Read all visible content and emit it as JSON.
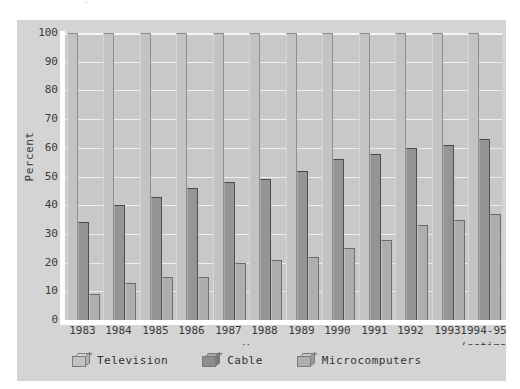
{
  "title_remnant": "\"",
  "chart_data": {
    "type": "bar",
    "title": "",
    "xlabel": "Year",
    "ylabel": "Percent",
    "ylim": [
      0,
      100
    ],
    "yticks": [
      100,
      90,
      80,
      70,
      60,
      50,
      40,
      30,
      20,
      10,
      0
    ],
    "grid": true,
    "legend_position": "bottom",
    "categories": [
      "1983",
      "1984",
      "1985",
      "1986",
      "1987",
      "1988",
      "1989",
      "1990",
      "1991",
      "1992",
      "1993",
      "1994-95"
    ],
    "category_sublabels": [
      "",
      "",
      "",
      "",
      "",
      "",
      "",
      "",
      "",
      "",
      "",
      "(estima"
    ],
    "series": [
      {
        "name": "Television",
        "color": "#c3c3c3",
        "values": [
          100,
          100,
          100,
          100,
          100,
          100,
          100,
          100,
          100,
          100,
          100,
          100
        ]
      },
      {
        "name": "Cable",
        "color": "#8e8e8e",
        "values": [
          34,
          40,
          43,
          46,
          48,
          49,
          52,
          56,
          58,
          60,
          61,
          63
        ]
      },
      {
        "name": "Microcomputers",
        "color": "#aeaeae",
        "values": [
          9,
          13,
          15,
          15,
          20,
          21,
          22,
          25,
          28,
          33,
          35,
          37
        ]
      }
    ]
  },
  "legend": {
    "items": [
      {
        "label": "Television"
      },
      {
        "label": "Cable"
      },
      {
        "label": "Microcomputers"
      }
    ]
  }
}
